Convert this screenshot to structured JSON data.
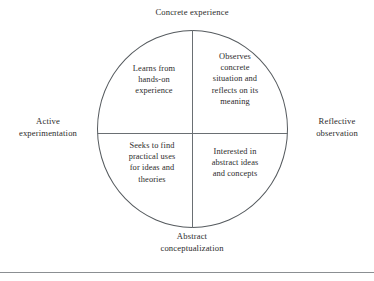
{
  "figure": {
    "name": "experiential-learning-cycle",
    "poles": {
      "top": "Concrete experience",
      "right": "Reflective\nobservation",
      "bottom": "Abstract\nconceptualization",
      "left": "Active\nexperimentation"
    },
    "quadrants": {
      "upper_left": "Learns from\nhands-on\nexperience",
      "upper_right": "Observes\nconcrete\nsituation and\nreflects on its\nmeaning",
      "lower_left": "Seeks to find\npractical uses\nfor ideas and\ntheories",
      "lower_right": "Interested in\nabstract ideas\nand concepts"
    },
    "colors": {
      "background": "#ffffff",
      "text": "#2b2b2b",
      "circle_stroke": "#555a5e",
      "axis_stroke": "#6a6f73",
      "rule": "#8b8f92"
    }
  }
}
